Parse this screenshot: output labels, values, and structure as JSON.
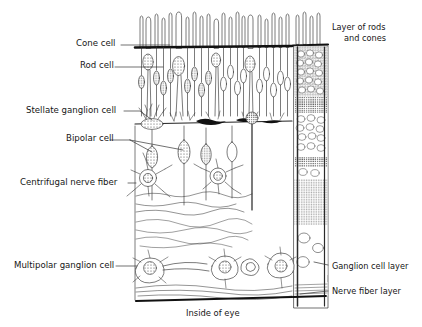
{
  "figure": {
    "caption_bottom": "Inside of eye",
    "background_color": "#ffffff",
    "ink_color": "#1a1a1a"
  },
  "labels_left": [
    {
      "id": "cone-cell",
      "text": "Cone cell",
      "x": 76,
      "y": 44
    },
    {
      "id": "rod-cell",
      "text": "Rod cell",
      "x": 80,
      "y": 66
    },
    {
      "id": "stellate-ganglion-cell",
      "text": "Stellate ganglion cell",
      "x": 26,
      "y": 113
    },
    {
      "id": "bipolar-cell",
      "text": "Bipolar cell",
      "x": 66,
      "y": 139
    },
    {
      "id": "centrifugal-nerve-fiber",
      "text": "Centrifugal nerve fiber",
      "x": 20,
      "y": 183
    },
    {
      "id": "multipolar-ganglion-cell",
      "text": "Multipolar ganglion cell",
      "x": 14,
      "y": 265
    }
  ],
  "labels_right": [
    {
      "id": "layer-of-rods-and-cones",
      "line1": "Layer of rods",
      "line2": "and cones",
      "x": 332,
      "y": 28
    },
    {
      "id": "ganglion-cell-layer",
      "line1": "Ganglion cell layer",
      "line2": "",
      "x": 332,
      "y": 267
    },
    {
      "id": "nerve-fiber-layer",
      "line1": "Nerve fiber layer",
      "line2": "",
      "x": 332,
      "y": 292
    }
  ]
}
